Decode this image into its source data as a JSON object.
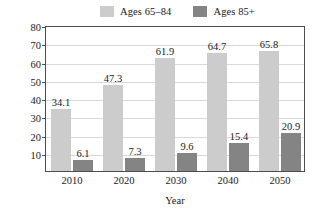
{
  "chart_data": {
    "type": "bar",
    "title": "",
    "xlabel": "Year",
    "ylabel": "Projected Population (millions)",
    "categories": [
      "2010",
      "2020",
      "2030",
      "2040",
      "2050"
    ],
    "series": [
      {
        "name": "Ages 65–84",
        "color": "#cccccc",
        "values": [
          34.1,
          47.3,
          61.9,
          64.7,
          65.8
        ],
        "labels": [
          "34.1",
          "47.3",
          "61.9",
          "64.7",
          "65.8"
        ]
      },
      {
        "name": "Ages 85+",
        "color": "#848484",
        "values": [
          6.1,
          7.3,
          9.6,
          15.4,
          20.9
        ],
        "labels": [
          "6.1",
          "7.3",
          "9.6",
          "15.4",
          "20.9"
        ]
      }
    ],
    "ylim": [
      0,
      80
    ],
    "ytick_labels": [
      "10",
      "20",
      "30",
      "40",
      "50",
      "60",
      "70",
      "80"
    ],
    "ytick_values": [
      10,
      20,
      30,
      40,
      50,
      60,
      70,
      80
    ],
    "grid": true,
    "legend_position": "top",
    "axis_color": "#4d4d4d",
    "grid_color": "#d9d9d9",
    "text_color": "#1a1a1a"
  },
  "legend": {
    "entries": [
      {
        "label": "Ages 65–84",
        "color": "#cccccc"
      },
      {
        "label": "Ages 85+",
        "color": "#848484"
      }
    ]
  }
}
